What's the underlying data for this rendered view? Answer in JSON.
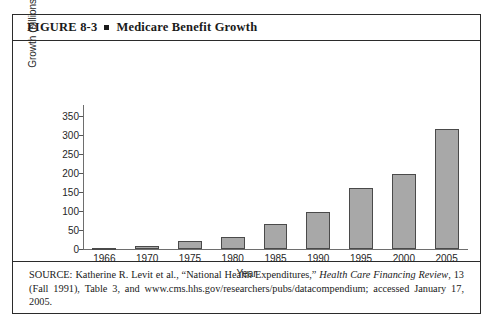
{
  "figure": {
    "label": "FIGURE 8-3",
    "bullet": "square-bullet",
    "title": "Medicare Benefit Growth"
  },
  "chart_data": {
    "type": "bar",
    "title": "Medicare Benefit Growth",
    "categories": [
      "1966",
      "1970",
      "1975",
      "1980",
      "1985",
      "1990",
      "1995",
      "2000",
      "2005"
    ],
    "values": [
      2,
      7,
      22,
      32,
      67,
      98,
      162,
      198,
      317
    ],
    "xlabel": "Year",
    "ylabel": "Growth (billions of dollars)",
    "ylim": [
      0,
      375
    ],
    "yticks": [
      0,
      50,
      100,
      150,
      200,
      250,
      300,
      350
    ],
    "ytick_labels": [
      "0",
      "50",
      "100",
      "150",
      "200",
      "250",
      "300",
      "350"
    ],
    "grid": false,
    "legend": null,
    "bar_fill_color": "#a8a8a8",
    "bar_edge_color": "#4a4a4a",
    "axis_color": "#6e6e6e"
  },
  "source": {
    "prefix": "SOURCE: Katherine R. Levit et al., “National Health Expenditures,” ",
    "italic_journal": "Health Care Financing Review",
    "suffix": ", 13 (Fall 1991), Table 3, and www.cms.hhs.gov/researchers/pubs/datacompendium; accessed January 17, 2005."
  }
}
